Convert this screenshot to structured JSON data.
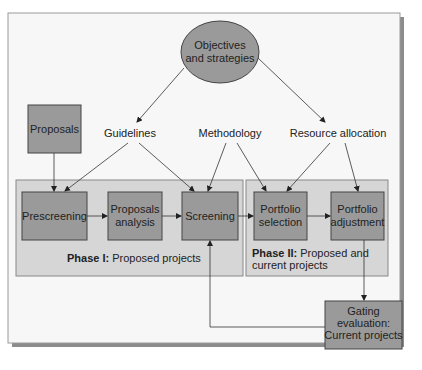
{
  "diagram": {
    "goal": {
      "lines": [
        "Objectives",
        "and strategies"
      ]
    },
    "inputs": {
      "proposals": "Proposals",
      "guidelines": "Guidelines",
      "methodology": "Methodology",
      "resource_allocation": "Resource allocation"
    },
    "phase1": {
      "title_bold": "Phase I:",
      "title_rest": "Proposed projects",
      "steps": {
        "prescreening": [
          "Prescreening"
        ],
        "proposals_analysis": [
          "Proposals",
          "analysis"
        ],
        "screening": [
          "Screening"
        ]
      }
    },
    "phase2": {
      "title_bold": "Phase II:",
      "title_rest": "Proposed and",
      "title_line2": "current projects",
      "steps": {
        "portfolio_selection": [
          "Portfolio",
          "selection"
        ],
        "portfolio_adjustment": [
          "Portfolio",
          "adjustment"
        ]
      }
    },
    "gating": {
      "lines": [
        "Gating",
        "evaluation:",
        "Current projects"
      ]
    },
    "colors": {
      "frame_bg": "#f7f7f7",
      "phase_bg": "#d6d6d6",
      "box_fill": "#9a9a9a",
      "ellipse_fill": "#9a9a9a",
      "stroke": "#3a3a3a"
    }
  }
}
